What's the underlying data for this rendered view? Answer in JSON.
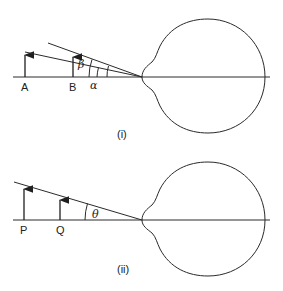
{
  "figure_i": {
    "caption": "(i)",
    "points": {
      "a": "A",
      "b": "B"
    },
    "angles": {
      "alpha": "α",
      "beta": "β"
    }
  },
  "figure_ii": {
    "caption": "(ii)",
    "points": {
      "p": "P",
      "q": "Q"
    },
    "angles": {
      "theta": "θ"
    }
  }
}
